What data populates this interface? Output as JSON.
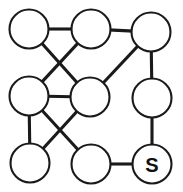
{
  "diagram": {
    "type": "node-link-graph",
    "background_color": "#ffffff",
    "stroke_color": "#1a1a1a",
    "node_fill_color": "#ffffff",
    "edge_width": 3.1,
    "node_stroke_width": 2.1,
    "canvas": {
      "width": 183,
      "height": 192
    }
  },
  "nodes": [
    {
      "id": "n1",
      "label": "",
      "cx": 29,
      "cy": 29,
      "r": 19.5,
      "row": "top",
      "col": "left"
    },
    {
      "id": "n2",
      "label": "",
      "cx": 91,
      "cy": 29,
      "r": 19.5,
      "row": "top",
      "col": "center"
    },
    {
      "id": "n3",
      "label": "",
      "cx": 151,
      "cy": 32,
      "r": 19.5,
      "row": "top",
      "col": "right"
    },
    {
      "id": "n4",
      "label": "",
      "cx": 29,
      "cy": 96,
      "r": 19.5,
      "row": "middle",
      "col": "left"
    },
    {
      "id": "n5",
      "label": "",
      "cx": 90,
      "cy": 97,
      "r": 19.5,
      "row": "middle",
      "col": "center"
    },
    {
      "id": "n6",
      "label": "",
      "cx": 152,
      "cy": 98,
      "r": 19.5,
      "row": "middle",
      "col": "right"
    },
    {
      "id": "n7",
      "label": "",
      "cx": 30,
      "cy": 163,
      "r": 19.5,
      "row": "bottom",
      "col": "left"
    },
    {
      "id": "n8",
      "label": "",
      "cx": 91,
      "cy": 164,
      "r": 19.5,
      "row": "bottom",
      "col": "center"
    },
    {
      "id": "n9",
      "label": "S",
      "cx": 152,
      "cy": 164,
      "r": 19.5,
      "row": "bottom",
      "col": "right"
    }
  ],
  "edges": [
    {
      "from": "n1",
      "to": "n2",
      "kind": "horizontal"
    },
    {
      "from": "n2",
      "to": "n3",
      "kind": "horizontal"
    },
    {
      "from": "n1",
      "to": "n5",
      "kind": "diagonal"
    },
    {
      "from": "n2",
      "to": "n4",
      "kind": "diagonal"
    },
    {
      "from": "n3",
      "to": "n5",
      "kind": "diagonal"
    },
    {
      "from": "n3",
      "to": "n6",
      "kind": "vertical"
    },
    {
      "from": "n4",
      "to": "n5",
      "kind": "horizontal"
    },
    {
      "from": "n4",
      "to": "n7",
      "kind": "vertical"
    },
    {
      "from": "n4",
      "to": "n8",
      "kind": "diagonal"
    },
    {
      "from": "n5",
      "to": "n7",
      "kind": "diagonal"
    },
    {
      "from": "n6",
      "to": "n9",
      "kind": "vertical"
    },
    {
      "from": "n8",
      "to": "n9",
      "kind": "horizontal"
    }
  ],
  "labels": {
    "start_node_label": "S"
  }
}
